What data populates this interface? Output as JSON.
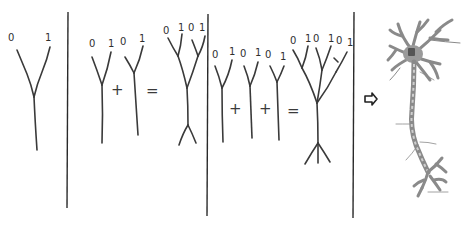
{
  "diagram": {
    "colors": {
      "ink": "#3a3a3a",
      "neuron": "#9a9a9a",
      "soma": "#555555",
      "background": "#ffffff"
    },
    "panels": [
      {
        "id": "panel-1",
        "trees": [
          {
            "leaf_labels": [
              "0",
              "1"
            ]
          }
        ],
        "operators": []
      },
      {
        "id": "panel-2",
        "trees": [
          {
            "leaf_labels": [
              "0",
              "1"
            ]
          },
          {
            "leaf_labels": [
              "0",
              "1"
            ]
          },
          {
            "leaf_labels": [
              "0",
              "1",
              "0",
              "1"
            ],
            "role": "result"
          }
        ],
        "operators": [
          "+",
          "="
        ]
      },
      {
        "id": "panel-3",
        "trees": [
          {
            "leaf_labels": [
              "0",
              "1"
            ]
          },
          {
            "leaf_labels": [
              "0",
              "1"
            ]
          },
          {
            "leaf_labels": [
              "0",
              "1"
            ]
          },
          {
            "leaf_labels": [
              "0",
              "1",
              "0",
              "1",
              "0",
              "1"
            ],
            "role": "result"
          }
        ],
        "operators": [
          "+",
          "+",
          "="
        ]
      },
      {
        "id": "panel-4",
        "arrow": "⇨",
        "image": "neuron-illustration"
      }
    ],
    "labels": {
      "p1_l0": "0",
      "p1_l1": "1",
      "p2_a0": "0",
      "p2_a1": "1",
      "p2_b0": "0",
      "p2_b1": "1",
      "p2_r0": "0",
      "p2_r1": "1",
      "p2_r2": "0",
      "p2_r3": "1",
      "p3_a0": "0",
      "p3_a1": "1",
      "p3_b0": "0",
      "p3_b1": "1",
      "p3_c0": "0",
      "p3_c1": "1",
      "p3_r0": "0",
      "p3_r1": "1",
      "p3_r2": "0",
      "p3_r3": "1",
      "p3_r4": "0",
      "p3_r5": "1",
      "plus": "+",
      "equals": "="
    }
  }
}
